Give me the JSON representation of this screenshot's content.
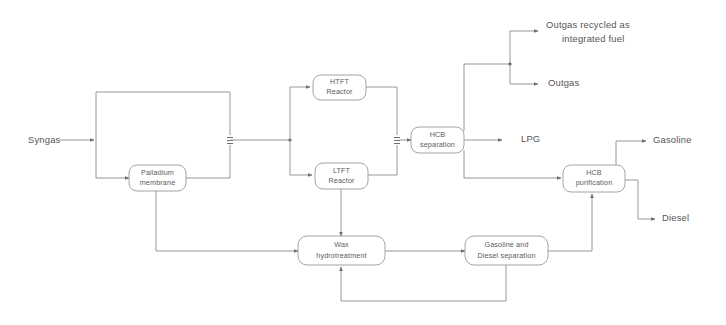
{
  "diagram": {
    "type": "process-flow-diagram",
    "background_color": "#ffffff",
    "line_color": "#8c8c8c",
    "text_color": "#555555",
    "nodes": [
      {
        "id": "palladium_membrane",
        "label_line1": "Palladium",
        "label_line2": "membrane"
      },
      {
        "id": "htft_reactor",
        "label_line1": "HTFT",
        "label_line2": "Reactor"
      },
      {
        "id": "ltft_reactor",
        "label_line1": "LTFT",
        "label_line2": "Reactor"
      },
      {
        "id": "hcb_separation",
        "label_line1": "HCB",
        "label_line2": "separation"
      },
      {
        "id": "hcb_purification",
        "label_line1": "HCB",
        "label_line2": "purification"
      },
      {
        "id": "wax_hydrotreatment",
        "label_line1": "Wax",
        "label_line2": "hydrotreatment"
      },
      {
        "id": "gasoline_diesel_separation",
        "label_line1": "Gasoline and",
        "label_line2": "Diesel separation"
      }
    ],
    "streams": [
      {
        "id": "syngas",
        "label": "Syngas"
      },
      {
        "id": "outgas_recycled",
        "label_line1": "Outgas recycled as",
        "label_line2": "integrated fuel"
      },
      {
        "id": "outgas",
        "label": "Outgas"
      },
      {
        "id": "lpg",
        "label": "LPG"
      },
      {
        "id": "gasoline",
        "label": "Gasoline"
      },
      {
        "id": "diesel",
        "label": "Diesel"
      }
    ]
  }
}
